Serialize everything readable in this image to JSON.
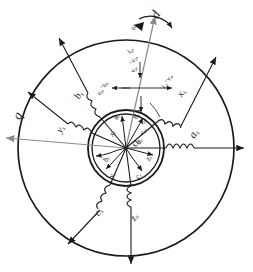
{
  "figure": {
    "type": "electric-machine-cross-section",
    "colors": {
      "line": "#1a1a1a",
      "axis": "#8a8a8a",
      "background": "#ffffff"
    }
  },
  "axes": {
    "d_axis": {
      "label": "d",
      "angle_deg": 70,
      "arrow": "up-right"
    },
    "q_axis": {
      "label": "q",
      "angle_deg": 160,
      "arrow": "left"
    },
    "rotation": {
      "label": "ω",
      "sub": "r",
      "symbol": "omega-r",
      "arc_arrow": "clockwise"
    },
    "rotor_angle": {
      "label": "θ",
      "sub": "r",
      "symbol": "theta-r"
    }
  },
  "stator": {
    "phases": [
      {
        "name": "a_s",
        "label": "a",
        "sub": "s",
        "angle_deg": 0,
        "winding": "coil"
      },
      {
        "name": "b_s",
        "label": "b",
        "sub": "s",
        "angle_deg": 120,
        "winding": "coil"
      },
      {
        "name": "c_s",
        "label": "c",
        "sub": "s",
        "angle_deg": 240,
        "winding": "coil"
      },
      {
        "name": "x_s",
        "label": "x",
        "sub": "s",
        "angle_deg": 40,
        "winding": "coil"
      },
      {
        "name": "y_s",
        "label": "y",
        "sub": "s",
        "angle_deg": 190,
        "winding": "coil"
      },
      {
        "name": "z_s",
        "label": "z",
        "sub": "s",
        "angle_deg": 270,
        "winding": "coil"
      }
    ]
  },
  "rotor": {
    "phases": [
      {
        "name": "a_r",
        "label": "a",
        "sub": "r",
        "angle_deg": 72
      },
      {
        "name": "b_r",
        "label": "b",
        "sub": "r",
        "angle_deg": 192
      },
      {
        "name": "c_r",
        "label": "c",
        "sub": "r",
        "angle_deg": 312
      },
      {
        "name": "x_r",
        "label": "x",
        "sub": "r",
        "angle_deg": 100
      },
      {
        "name": "y_r",
        "label": "y",
        "sub": "r",
        "angle_deg": 232
      },
      {
        "name": "z_r",
        "label": "z",
        "sub": "r",
        "angle_deg": 290
      }
    ]
  },
  "terminals": [
    {
      "name": "v_as_plus",
      "label": "+",
      "aux": "v",
      "sub": "as",
      "position": "right-of-axis-top"
    },
    {
      "name": "i_as",
      "label": "i",
      "sub": "as",
      "position": "right-of-axis-top"
    },
    {
      "name": "v_ar_plus",
      "label": "+",
      "aux": "v",
      "sub": "ar",
      "position": "axis-upper"
    },
    {
      "name": "i_ar",
      "label": "i",
      "sub": "ar",
      "position": "axis-upper"
    },
    {
      "name": "v_bs",
      "label": "v",
      "sub": "bs",
      "position": "left-of-axis-top"
    },
    {
      "name": "i_bs",
      "label": "i",
      "sub": "bs",
      "position": "left-of-axis-top"
    }
  ],
  "annotations": {
    "center_label": "O",
    "top_axis_label": "d",
    "left_axis_label": "q"
  }
}
